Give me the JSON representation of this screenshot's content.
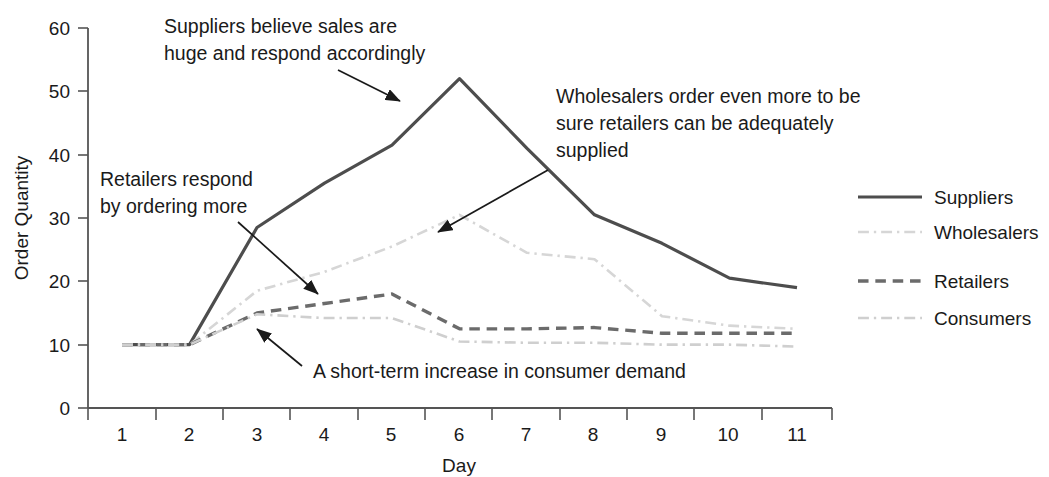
{
  "chart_data": {
    "type": "line",
    "title": "",
    "xlabel": "Day",
    "ylabel": "Order Quantity",
    "x": [
      1,
      2,
      3,
      4,
      5,
      6,
      7,
      8,
      9,
      10,
      11
    ],
    "xtick_labels": [
      "1",
      "2",
      "3",
      "4",
      "5",
      "6",
      "7",
      "8",
      "9",
      "10",
      "11"
    ],
    "ytick_labels": [
      "0",
      "10",
      "20",
      "30",
      "40",
      "50",
      "60"
    ],
    "yticks": [
      0,
      10,
      20,
      30,
      40,
      50,
      60
    ],
    "ylim": [
      0,
      60
    ],
    "xlim": [
      1,
      11
    ],
    "grid": false,
    "legend_position": "right",
    "series": [
      {
        "name": "Suppliers",
        "color": "#4d4d4d",
        "style": "solid",
        "width": 3.2,
        "values": [
          10,
          10,
          28.5,
          35.5,
          41.5,
          52,
          41,
          30.5,
          26,
          20.5,
          19
        ]
      },
      {
        "name": "Wholesalers",
        "color": "#d6d6d6",
        "style": "dashdot",
        "width": 2.6,
        "values": [
          10,
          10,
          18.5,
          21.5,
          25.5,
          30.5,
          24.5,
          23.5,
          14.5,
          13,
          12.5
        ]
      },
      {
        "name": "Retailers",
        "color": "#6b6b6b",
        "style": "dashed",
        "width": 3.4,
        "values": [
          10,
          10,
          15,
          16.5,
          18,
          12.5,
          12.5,
          12.7,
          11.8,
          11.8,
          11.8
        ]
      },
      {
        "name": "Consumers",
        "color": "#cfcfcf",
        "style": "dashdot",
        "width": 2.6,
        "values": [
          10,
          10,
          14.8,
          14.2,
          14.2,
          10.5,
          10.3,
          10.3,
          10,
          10,
          9.7
        ]
      }
    ],
    "annotations": [
      {
        "id": "suppliers-note",
        "lines": [
          "Suppliers believe sales are",
          "huge and respond accordingly"
        ],
        "text": "Suppliers believe sales are huge and respond accordingly"
      },
      {
        "id": "wholesalers-note",
        "lines": [
          "Wholesalers order even more to be",
          "sure retailers can be adequately",
          "supplied"
        ],
        "text": "Wholesalers order even more to be sure retailers can be adequately supplied"
      },
      {
        "id": "retailers-note",
        "lines": [
          "Retailers respond",
          "by ordering more"
        ],
        "text": "Retailers respond by ordering more"
      },
      {
        "id": "consumers-note",
        "lines": [
          "A short-term increase in consumer demand"
        ],
        "text": "A short-term increase in consumer demand"
      }
    ]
  },
  "axes": {
    "y_title": "Order Quantity",
    "x_title": "Day",
    "y_labels": {
      "t0": "0",
      "t1": "10",
      "t2": "20",
      "t3": "30",
      "t4": "40",
      "t5": "50",
      "t6": "60"
    },
    "x_labels": {
      "d1": "1",
      "d2": "2",
      "d3": "3",
      "d4": "4",
      "d5": "5",
      "d6": "6",
      "d7": "7",
      "d8": "8",
      "d9": "9",
      "d10": "10",
      "d11": "11"
    }
  },
  "legend": {
    "items": [
      {
        "label": "Suppliers"
      },
      {
        "label": "Wholesalers"
      },
      {
        "label": "Retailers"
      },
      {
        "label": "Consumers"
      }
    ]
  },
  "annotations": {
    "suppliers_l1": "Suppliers believe sales are",
    "suppliers_l2": "huge and respond accordingly",
    "wholesalers_l1": "Wholesalers order even more to be",
    "wholesalers_l2": "sure retailers can be adequately",
    "wholesalers_l3": "supplied",
    "retailers_l1": "Retailers respond",
    "retailers_l2": "by ordering more",
    "consumers_l1": "A short-term increase in consumer demand"
  }
}
